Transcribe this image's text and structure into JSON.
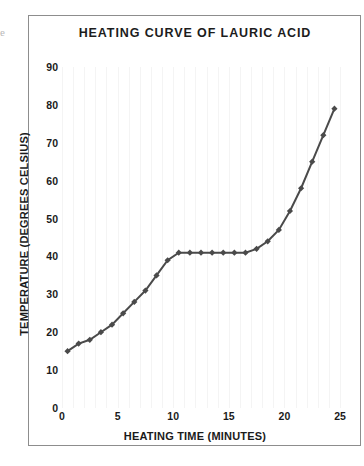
{
  "figure": {
    "edge_glyph": "e",
    "background_color": "#ffffff",
    "frame_color": "#8d8d8d"
  },
  "chart_data": {
    "type": "line",
    "title": "HEATING CURVE OF LAURIC ACID",
    "xlabel": "HEATING TIME (MINUTES)",
    "ylabel": "TEMPERATURE (DEGREES CELSIUS)",
    "xlim": [
      0,
      25
    ],
    "ylim": [
      0,
      90
    ],
    "xticks": [
      0,
      5,
      10,
      15,
      20,
      25
    ],
    "yticks": [
      0,
      10,
      20,
      30,
      40,
      50,
      60,
      70,
      80,
      90
    ],
    "grid": "vertical-faint",
    "legend": "none",
    "marker": "diamond",
    "series_color": "#4a4a4a",
    "series": [
      {
        "name": "Lauric acid temperature",
        "x": [
          0.5,
          1.5,
          2.5,
          3.5,
          4.5,
          5.5,
          6.5,
          7.5,
          8.5,
          9.5,
          10.5,
          11.5,
          12.5,
          13.5,
          14.5,
          15.5,
          16.5,
          17.5,
          18.5,
          19.5,
          20.5,
          21.5,
          22.5,
          23.5,
          24.5
        ],
        "y": [
          15,
          17,
          18,
          20,
          22,
          25,
          28,
          31,
          35,
          39,
          41,
          41,
          41,
          41,
          41,
          41,
          41,
          42,
          44,
          47,
          52,
          58,
          65,
          72,
          79
        ]
      }
    ]
  }
}
